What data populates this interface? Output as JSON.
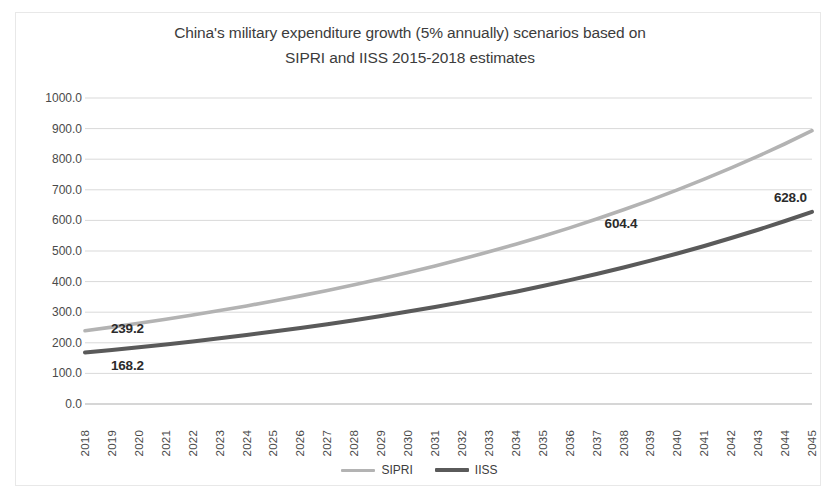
{
  "chart_data": {
    "type": "line",
    "title": "China's military expenditure growth (5% annually) scenarios based on SIPRI and IISS 2015-2018 estimates",
    "title_line1": "China's military expenditure growth (5% annually) scenarios based on",
    "title_line2": "SIPRI and IISS 2015-2018 estimates",
    "xlabel": "",
    "ylabel": "",
    "x": [
      2018,
      2019,
      2020,
      2021,
      2022,
      2023,
      2024,
      2025,
      2026,
      2027,
      2028,
      2029,
      2030,
      2031,
      2032,
      2033,
      2034,
      2035,
      2036,
      2037,
      2038,
      2039,
      2040,
      2041,
      2042,
      2043,
      2044,
      2045
    ],
    "categories": [
      "2018",
      "2019",
      "2020",
      "2021",
      "2022",
      "2023",
      "2024",
      "2025",
      "2026",
      "2027",
      "2028",
      "2029",
      "2030",
      "2031",
      "2032",
      "2033",
      "2034",
      "2035",
      "2036",
      "2037",
      "2038",
      "2039",
      "2040",
      "2041",
      "2042",
      "2043",
      "2044",
      "2045"
    ],
    "ylim": [
      0,
      1000
    ],
    "ytick_values": [
      0,
      100,
      200,
      300,
      400,
      500,
      600,
      700,
      800,
      900,
      1000
    ],
    "ytick_labels": [
      "0.0",
      "100.0",
      "200.0",
      "300.0",
      "400.0",
      "500.0",
      "600.0",
      "700.0",
      "800.0",
      "900.0",
      "1000.0"
    ],
    "grid": true,
    "legend_position": "bottom",
    "growth_rate_percent": 5,
    "series": [
      {
        "name": "SIPRI",
        "color": "#b3b3b3",
        "start_value": 239.2,
        "end_value": 898.1,
        "values": [
          239.2,
          251.2,
          263.7,
          276.9,
          290.7,
          305.3,
          320.5,
          336.6,
          353.4,
          371.1,
          389.6,
          409.1,
          429.6,
          451.0,
          473.6,
          497.3,
          522.1,
          548.2,
          575.6,
          604.4,
          634.6,
          666.4,
          699.7,
          734.7,
          771.4,
          810.0,
          850.5,
          893.0
        ]
      },
      {
        "name": "IISS",
        "color": "#5a5a5a",
        "start_value": 168.2,
        "end_value": 628.0,
        "values": [
          168.2,
          176.6,
          185.4,
          194.7,
          204.4,
          214.6,
          225.4,
          236.6,
          248.4,
          260.9,
          273.9,
          287.6,
          302.0,
          317.1,
          332.9,
          349.6,
          367.1,
          385.4,
          404.7,
          425.0,
          446.2,
          468.5,
          491.9,
          516.5,
          542.4,
          569.5,
          598.0,
          628.0
        ]
      }
    ],
    "annotations": [
      {
        "text": "239.2",
        "series": "SIPRI",
        "x": 2018,
        "value": 239.2
      },
      {
        "text": "168.2",
        "series": "IISS",
        "x": 2018,
        "value": 168.2
      },
      {
        "text": "604.4",
        "series": "SIPRI",
        "x": 2037,
        "value": 604.4
      },
      {
        "text": "628.0",
        "series": "IISS",
        "x": 2045,
        "value": 628.0
      }
    ]
  },
  "legend": {
    "items": [
      {
        "label": "SIPRI",
        "color": "#b3b3b3"
      },
      {
        "label": "IISS",
        "color": "#5a5a5a"
      }
    ]
  },
  "colors": {
    "sipri": "#b3b3b3",
    "iiss": "#5a5a5a",
    "grid": "#d9d9d9",
    "axis": "#bfbfbf",
    "text": "#3c3c3c",
    "background": "#ffffff"
  }
}
